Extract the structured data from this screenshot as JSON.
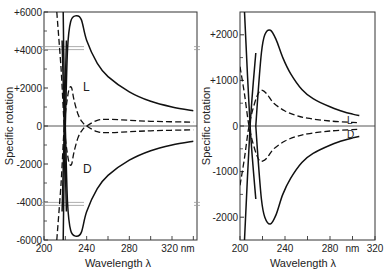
{
  "chart_data": [
    {
      "type": "line",
      "panel": "left",
      "title": "",
      "xlabel": "Wavelength λ",
      "ylabel": "Specific rotation",
      "x_unit": "nm",
      "xlim": [
        200,
        340
      ],
      "ylim": [
        -6000,
        6000
      ],
      "xticks": [
        200,
        240,
        280,
        320
      ],
      "xtick_labels": [
        "200",
        "240",
        "280",
        "320 nm"
      ],
      "yticks": [
        6000,
        4000,
        2000,
        0,
        -2000,
        -4000,
        -6000
      ],
      "ytick_labels": [
        "+6000",
        "+4000",
        "+2000",
        "0",
        "-2000",
        "-4000",
        "-6000"
      ],
      "axis_breaks_y": [
        4100,
        -4100
      ],
      "grid": false,
      "annotations": [
        {
          "text": "L",
          "x": 234,
          "y": 1800
        },
        {
          "text": "D",
          "x": 234,
          "y": -1800
        }
      ],
      "series": [
        {
          "name": "L (solid)",
          "style": "solid",
          "x": [
            218,
            219,
            220,
            222,
            225,
            230,
            235,
            240,
            250,
            260,
            280,
            300,
            320,
            340
          ],
          "y": [
            -6000,
            -2000,
            0,
            4000,
            5500,
            5800,
            5600,
            4500,
            3300,
            2600,
            1800,
            1300,
            1000,
            800
          ]
        },
        {
          "name": "D (solid)",
          "style": "solid",
          "x": [
            218,
            219,
            220,
            222,
            225,
            230,
            235,
            240,
            250,
            260,
            280,
            300,
            320,
            340
          ],
          "y": [
            6000,
            2000,
            0,
            -4000,
            -5500,
            -5800,
            -5600,
            -4500,
            -3300,
            -2600,
            -1800,
            -1300,
            -1000,
            -800
          ]
        },
        {
          "name": "L (dashed)",
          "style": "dashed",
          "x": [
            212,
            216,
            219,
            222,
            224,
            226,
            228,
            232,
            236,
            240,
            250,
            260,
            280,
            300,
            340
          ],
          "y": [
            -6000,
            -3000,
            0,
            1500,
            2000,
            2000,
            1400,
            600,
            200,
            0,
            -300,
            -350,
            -300,
            -250,
            -200
          ]
        },
        {
          "name": "D (dashed)",
          "style": "dashed",
          "x": [
            212,
            216,
            219,
            222,
            224,
            226,
            228,
            232,
            236,
            240,
            250,
            260,
            280,
            300,
            340
          ],
          "y": [
            6000,
            3000,
            0,
            -1500,
            -2000,
            -2000,
            -1400,
            -600,
            -200,
            0,
            300,
            350,
            300,
            250,
            200
          ]
        },
        {
          "name": "steep solid (L)",
          "style": "solid",
          "x": [
            217,
            219,
            221
          ],
          "y": [
            4500,
            0,
            -4500
          ]
        },
        {
          "name": "steep solid (D)",
          "style": "solid",
          "x": [
            217,
            219,
            221
          ],
          "y": [
            -4500,
            0,
            4500
          ]
        }
      ]
    },
    {
      "type": "line",
      "panel": "right",
      "title": "",
      "xlabel": "Wavelength λ",
      "ylabel": "Specific rotation",
      "x_unit": "nm",
      "xlim": [
        200,
        320
      ],
      "ylim": [
        -2500,
        2500
      ],
      "xticks": [
        200,
        240,
        280,
        320
      ],
      "xtick_labels": [
        "200",
        "240",
        "280",
        "320"
      ],
      "x_unit_label_position": 300,
      "yticks": [
        2000,
        1000,
        0,
        -1000,
        -2000
      ],
      "ytick_labels": [
        "+2000",
        "+1000",
        "0",
        "-1000",
        "-2000"
      ],
      "grid": false,
      "annotations": [
        {
          "text": "L",
          "x": 302,
          "y": 150
        },
        {
          "text": "D",
          "x": 302,
          "y": -150
        }
      ],
      "series": [
        {
          "name": "L (solid)",
          "style": "solid",
          "x": [
            214,
            216,
            219,
            222,
            227,
            232,
            238,
            245,
            255,
            265,
            280,
            290,
            300,
            306
          ],
          "y": [
            0,
            700,
            1600,
            2000,
            2100,
            1900,
            1500,
            1150,
            800,
            600,
            420,
            330,
            260,
            230
          ]
        },
        {
          "name": "D (solid)",
          "style": "solid",
          "x": [
            214,
            216,
            219,
            222,
            227,
            232,
            238,
            245,
            255,
            265,
            280,
            290,
            300,
            306
          ],
          "y": [
            0,
            -700,
            -1600,
            -2000,
            -2150,
            -1950,
            -1500,
            -1150,
            -800,
            -600,
            -420,
            -330,
            -260,
            -230
          ]
        },
        {
          "name": "L steep (solid)",
          "style": "solid",
          "x": [
            204,
            209,
            214
          ],
          "y": [
            2500,
            0,
            -1600
          ]
        },
        {
          "name": "D steep (solid)",
          "style": "solid",
          "x": [
            204,
            209,
            214
          ],
          "y": [
            -2500,
            0,
            1600
          ]
        },
        {
          "name": "L (dashed)",
          "style": "dashed",
          "x": [
            200,
            204,
            208,
            213,
            217,
            220,
            224,
            230,
            240,
            250,
            260,
            280,
            300,
            306
          ],
          "y": [
            1300,
            700,
            0,
            -500,
            -750,
            -770,
            -700,
            -500,
            -330,
            -230,
            -170,
            -110,
            -80,
            -70
          ]
        },
        {
          "name": "D (dashed)",
          "style": "dashed",
          "x": [
            200,
            204,
            208,
            213,
            217,
            220,
            224,
            230,
            240,
            250,
            260,
            280,
            300,
            306
          ],
          "y": [
            -1300,
            -700,
            0,
            500,
            750,
            780,
            700,
            500,
            330,
            230,
            170,
            110,
            80,
            70
          ]
        }
      ]
    }
  ],
  "labels": {
    "left_ylabel": "Specific rotation",
    "left_xlabel": "Wavelength λ",
    "right_ylabel": "Specific rotation",
    "right_xlabel": "Wavelength λ",
    "right_nm": "nm",
    "left_L": "L",
    "left_D": "D",
    "right_L": "L",
    "right_D": "D"
  }
}
